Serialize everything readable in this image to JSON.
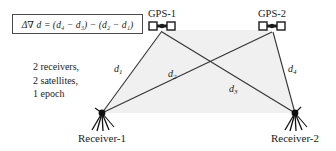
{
  "figure": {
    "background_color": "#ffffff",
    "line_color": "#333333",
    "shade_color": "#ededed"
  },
  "formula": {
    "text": "Δ∇ d = (d₄ − d₃) − (d₂ − d₁)",
    "border_color": "#4a4a4a"
  },
  "satellites": [
    {
      "id": "gps-1",
      "label": "GPS-1",
      "x": 162,
      "y": 30,
      "label_x": 162,
      "label_y": 9
    },
    {
      "id": "gps-2",
      "label": "GPS-2",
      "x": 272,
      "y": 30,
      "label_x": 272,
      "label_y": 9
    }
  ],
  "receivers": [
    {
      "id": "receiver-1",
      "label": "Receiver-1",
      "x": 102,
      "y": 113,
      "label_x": 102,
      "label_y": 139
    },
    {
      "id": "receiver-2",
      "label": "Receiver-2",
      "x": 295,
      "y": 113,
      "label_x": 295,
      "label_y": 139
    }
  ],
  "baselines": [
    {
      "id": "d1",
      "label": "d",
      "sub": "1",
      "from": "receiver-1",
      "to": "gps-1",
      "label_x": 114,
      "label_y": 68
    },
    {
      "id": "d2",
      "label": "d",
      "sub": "2",
      "from": "receiver-1",
      "to": "gps-2",
      "label_x": 168,
      "label_y": 73
    },
    {
      "id": "d3",
      "label": "d",
      "sub": "3",
      "from": "receiver-2",
      "to": "gps-1",
      "label_x": 229,
      "label_y": 88
    },
    {
      "id": "d4",
      "label": "d",
      "sub": "4",
      "from": "receiver-2",
      "to": "gps-2",
      "label_x": 288,
      "label_y": 68
    }
  ],
  "info": {
    "line1": "2 receivers,",
    "line2": "2 satellites,",
    "line3": "1 epoch"
  }
}
